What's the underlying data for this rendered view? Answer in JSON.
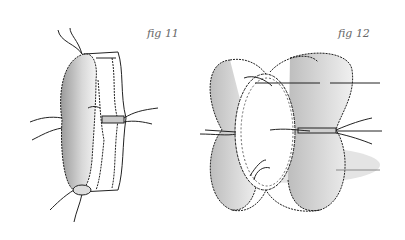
{
  "figures": [
    {
      "id": "fig11",
      "caption": "fig 11",
      "description": "Single ribbon loop joined with stitched band, threads extending"
    },
    {
      "id": "fig12",
      "caption": "fig 12",
      "description": "Multiple ribbon loops gathered around a center with stitched band and threads"
    }
  ]
}
